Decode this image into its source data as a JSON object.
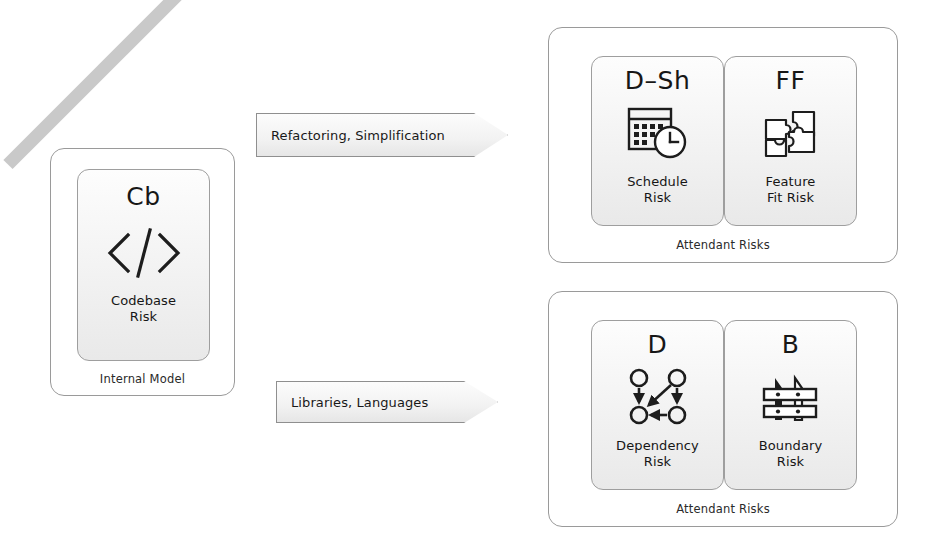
{
  "internal_model": {
    "container_label": "Internal Model",
    "card": {
      "abbr": "Cb",
      "title": "Codebase\nRisk",
      "title_line1": "Codebase",
      "title_line2": "Risk",
      "icon": "code-brackets-icon",
      "struck_through": true,
      "strike_color": "#c9c9c9"
    }
  },
  "arrows": [
    {
      "name": "arrow-refactoring",
      "label": "Refactoring, Simplification"
    },
    {
      "name": "arrow-libraries",
      "label": "Libraries, Languages"
    }
  ],
  "attendant_groups": [
    {
      "container_label": "Attendant Risks",
      "cards": [
        {
          "abbr": "D–Sh",
          "title_line1": "Schedule",
          "title_line2": "Risk",
          "icon": "calendar-clock-icon"
        },
        {
          "abbr": "FF",
          "title_line1": "Feature",
          "title_line2": "Fit Risk",
          "icon": "puzzle-pieces-icon"
        }
      ]
    },
    {
      "container_label": "Attendant Risks",
      "cards": [
        {
          "abbr": "D",
          "title_line1": "Dependency",
          "title_line2": "Risk",
          "icon": "dependency-graph-icon"
        },
        {
          "abbr": "B",
          "title_line1": "Boundary",
          "title_line2": "Risk",
          "icon": "fence-icon"
        }
      ]
    }
  ],
  "colors": {
    "background": "#ffffff",
    "card_border": "#9e9e9e",
    "container_border": "#9a9a9a",
    "text": "#161616",
    "icon_stroke": "#1d1d1d",
    "strike": "#c9c9c9"
  }
}
